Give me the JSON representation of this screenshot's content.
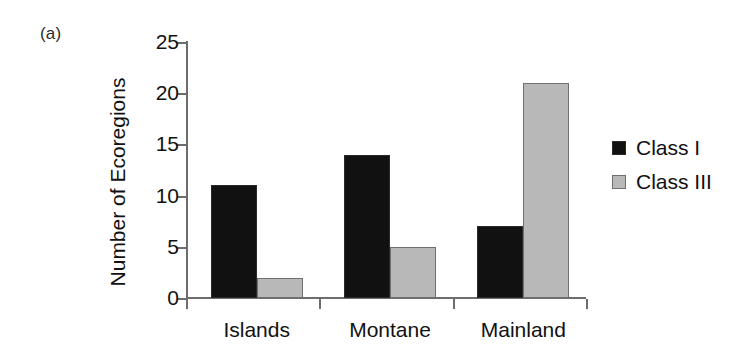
{
  "panel": {
    "label": "(a)"
  },
  "chart_data": {
    "type": "bar",
    "title": "",
    "xlabel": "",
    "ylabel": "Number of Ecoregions",
    "categories": [
      "Islands",
      "Montane",
      "Mainland"
    ],
    "series": [
      {
        "name": "Class I",
        "color": "#111111",
        "values": [
          11,
          14,
          7
        ]
      },
      {
        "name": "Class III",
        "color": "#b8b8b8",
        "values": [
          2,
          5,
          21
        ]
      }
    ],
    "ylim": [
      0,
      25
    ],
    "yticks": [
      0,
      5,
      10,
      15,
      20,
      25
    ],
    "ytick_labels": [
      "0",
      "5",
      "10",
      "15",
      "20",
      "25"
    ],
    "grid": false,
    "legend_position": "right"
  },
  "legend": {
    "entries": [
      {
        "label": "Class I",
        "swatch": "classI"
      },
      {
        "label": "Class III",
        "swatch": "classIII"
      }
    ]
  },
  "axis_colors": {
    "spine": "#6d6d6d",
    "text": "#111111"
  }
}
